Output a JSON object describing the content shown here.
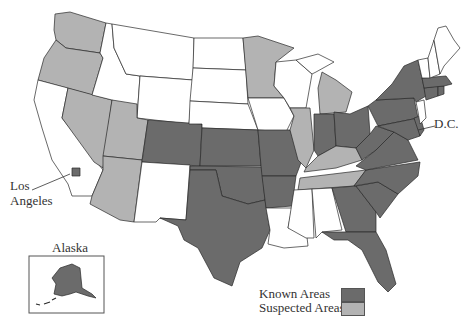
{
  "colors": {
    "known": "#6b6b6b",
    "suspected": "#b3b3b3",
    "none": "#ffffff",
    "stroke": "#2a2a2a"
  },
  "labels": {
    "dc": "D.C.",
    "los_angeles_line1": "Los",
    "los_angeles_line2": "Angeles",
    "alaska": "Alaska"
  },
  "legend": {
    "known_label": "Known Areas",
    "suspected_label": "Suspected Areas"
  },
  "states": {
    "known": [
      "Colorado",
      "Kansas",
      "Oklahoma",
      "Texas",
      "Missouri",
      "Arkansas",
      "Indiana",
      "Ohio",
      "West Virginia",
      "Virginia",
      "North Carolina",
      "South Carolina",
      "Georgia",
      "Florida",
      "Pennsylvania",
      "New York",
      "Massachusetts",
      "Connecticut",
      "Rhode Island",
      "Maryland",
      "Delaware",
      "Alaska",
      "Los Angeles (county)"
    ],
    "suspected": [
      "Washington",
      "Oregon",
      "Nevada",
      "Utah",
      "Arizona",
      "Minnesota",
      "Illinois",
      "Michigan",
      "Kentucky",
      "Tennessee"
    ],
    "none": [
      "California",
      "Idaho",
      "Montana",
      "Wyoming",
      "North Dakota",
      "South Dakota",
      "Nebraska",
      "New Mexico",
      "Iowa",
      "Wisconsin",
      "Louisiana",
      "Mississippi",
      "Alabama",
      "Maine",
      "New Hampshire",
      "Vermont",
      "New Jersey"
    ]
  }
}
